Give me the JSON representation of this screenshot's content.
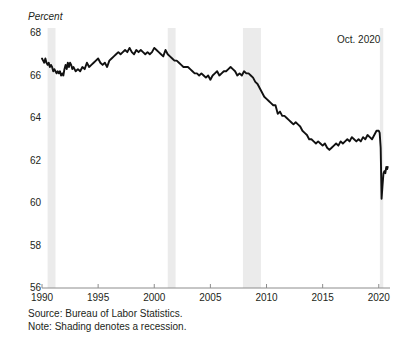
{
  "figure": {
    "title": "",
    "annotation": "Oct. 2020",
    "source_note": "Source: Bureau of Labor Statistics.",
    "shading_note": "Note: Shading denotes a recession."
  },
  "colors": {
    "line": "#111111",
    "axis": "#8c8c8c",
    "recession_shading": "#ebebeb",
    "text": "#231f20",
    "background": "#ffffff"
  },
  "chart_data": {
    "type": "line",
    "title": "",
    "subtitle": "",
    "xlabel": "",
    "ylabel": "Percent",
    "xlim": [
      1990,
      2021
    ],
    "ylim": [
      56,
      68
    ],
    "grid": false,
    "legend": null,
    "yticks": [
      68,
      66,
      64,
      62,
      60,
      58,
      56
    ],
    "xticks": [
      1990,
      1995,
      2000,
      2005,
      2010,
      2015,
      2020
    ],
    "ytick_labels": [
      "68",
      "66",
      "64",
      "62",
      "60",
      "58",
      "56"
    ],
    "xtick_labels": [
      "1990",
      "1995",
      "2000",
      "2005",
      "2010",
      "2015",
      "2020"
    ],
    "annotations": [
      {
        "text": "Oct. 2020",
        "x": 2020.8,
        "y": 67.4
      }
    ],
    "shaded_regions": [
      {
        "label": "recession 1990-1991",
        "x0": 1990.5,
        "x1": 1991.2
      },
      {
        "label": "recession 2001",
        "x0": 2001.2,
        "x1": 2001.9
      },
      {
        "label": "recession 2007-2009",
        "x0": 2007.9,
        "x1": 2009.5
      },
      {
        "label": "recession 2020",
        "x0": 2020.1,
        "x1": 2020.4
      }
    ],
    "series": [
      {
        "name": "Labor force participation rate",
        "x": [
          1990.0,
          1990.1,
          1990.2,
          1990.3,
          1990.4,
          1990.5,
          1990.6,
          1990.7,
          1990.8,
          1990.9,
          1991.0,
          1991.1,
          1991.2,
          1991.3,
          1991.4,
          1991.5,
          1991.6,
          1991.7,
          1991.8,
          1991.9,
          1992.0,
          1992.1,
          1992.2,
          1992.3,
          1992.4,
          1992.5,
          1992.6,
          1992.7,
          1992.8,
          1992.9,
          1993.0,
          1993.2,
          1993.4,
          1993.6,
          1993.8,
          1994.0,
          1994.2,
          1994.4,
          1994.6,
          1994.8,
          1995.0,
          1995.2,
          1995.4,
          1995.6,
          1995.8,
          1996.0,
          1996.2,
          1996.4,
          1996.6,
          1996.8,
          1997.0,
          1997.2,
          1997.4,
          1997.6,
          1997.8,
          1998.0,
          1998.2,
          1998.4,
          1998.6,
          1998.8,
          1999.0,
          1999.2,
          1999.4,
          1999.6,
          1999.8,
          2000.0,
          2000.2,
          2000.4,
          2000.6,
          2000.8,
          2001.0,
          2001.2,
          2001.4,
          2001.6,
          2001.8,
          2002.0,
          2002.2,
          2002.4,
          2002.6,
          2002.8,
          2003.0,
          2003.2,
          2003.4,
          2003.6,
          2003.8,
          2004.0,
          2004.2,
          2004.4,
          2004.6,
          2004.8,
          2005.0,
          2005.2,
          2005.4,
          2005.6,
          2005.8,
          2006.0,
          2006.2,
          2006.4,
          2006.6,
          2006.8,
          2007.0,
          2007.2,
          2007.4,
          2007.6,
          2007.8,
          2008.0,
          2008.2,
          2008.4,
          2008.6,
          2008.8,
          2009.0,
          2009.2,
          2009.4,
          2009.6,
          2009.8,
          2010.0,
          2010.2,
          2010.4,
          2010.6,
          2010.8,
          2011.0,
          2011.2,
          2011.4,
          2011.6,
          2011.8,
          2012.0,
          2012.2,
          2012.4,
          2012.6,
          2012.8,
          2013.0,
          2013.2,
          2013.4,
          2013.6,
          2013.8,
          2014.0,
          2014.2,
          2014.4,
          2014.6,
          2014.8,
          2015.0,
          2015.2,
          2015.4,
          2015.6,
          2015.8,
          2016.0,
          2016.2,
          2016.4,
          2016.6,
          2016.8,
          2017.0,
          2017.2,
          2017.4,
          2017.6,
          2017.8,
          2018.0,
          2018.2,
          2018.4,
          2018.6,
          2018.8,
          2019.0,
          2019.2,
          2019.4,
          2019.6,
          2019.8,
          2020.0,
          2020.08,
          2020.17,
          2020.25,
          2020.33,
          2020.42,
          2020.5,
          2020.58,
          2020.67,
          2020.75,
          2020.8
        ],
        "y": [
          66.8,
          66.7,
          66.6,
          66.8,
          66.6,
          66.5,
          66.6,
          66.4,
          66.5,
          66.4,
          66.2,
          66.3,
          66.2,
          66.1,
          66.2,
          66.1,
          66.2,
          66.0,
          66.1,
          66.0,
          66.3,
          66.5,
          66.3,
          66.6,
          66.4,
          66.6,
          66.5,
          66.3,
          66.4,
          66.3,
          66.2,
          66.3,
          66.2,
          66.4,
          66.3,
          66.6,
          66.4,
          66.5,
          66.6,
          66.7,
          66.8,
          66.6,
          66.5,
          66.6,
          66.4,
          66.7,
          66.8,
          66.9,
          67.0,
          67.1,
          67.0,
          67.1,
          67.2,
          67.1,
          67.3,
          67.1,
          67.0,
          67.2,
          67.1,
          67.2,
          67.1,
          67.0,
          67.1,
          67.0,
          67.1,
          67.3,
          67.2,
          67.1,
          67.0,
          66.9,
          67.2,
          67.0,
          66.9,
          66.8,
          66.7,
          66.7,
          66.6,
          66.5,
          66.4,
          66.4,
          66.4,
          66.3,
          66.2,
          66.1,
          66.1,
          66.0,
          66.1,
          66.0,
          65.9,
          66.0,
          65.8,
          66.0,
          66.1,
          66.2,
          66.0,
          66.1,
          66.2,
          66.2,
          66.3,
          66.4,
          66.3,
          66.2,
          66.0,
          66.1,
          66.0,
          66.2,
          66.1,
          66.1,
          66.0,
          65.9,
          65.7,
          65.6,
          65.4,
          65.2,
          65.0,
          64.9,
          64.8,
          64.7,
          64.6,
          64.6,
          64.2,
          64.3,
          64.1,
          64.1,
          64.0,
          63.9,
          63.8,
          63.7,
          63.8,
          63.7,
          63.6,
          63.4,
          63.3,
          63.2,
          63.0,
          63.0,
          62.9,
          62.8,
          62.9,
          62.8,
          62.7,
          62.8,
          62.6,
          62.5,
          62.6,
          62.7,
          62.8,
          62.7,
          62.9,
          62.8,
          62.9,
          63.0,
          62.9,
          63.1,
          63.0,
          62.9,
          63.0,
          62.9,
          63.1,
          63.0,
          63.2,
          63.1,
          63.0,
          63.2,
          63.4,
          63.4,
          63.3,
          62.6,
          60.2,
          60.8,
          61.4,
          61.5,
          61.4,
          61.7,
          61.6,
          61.7
        ]
      }
    ]
  }
}
